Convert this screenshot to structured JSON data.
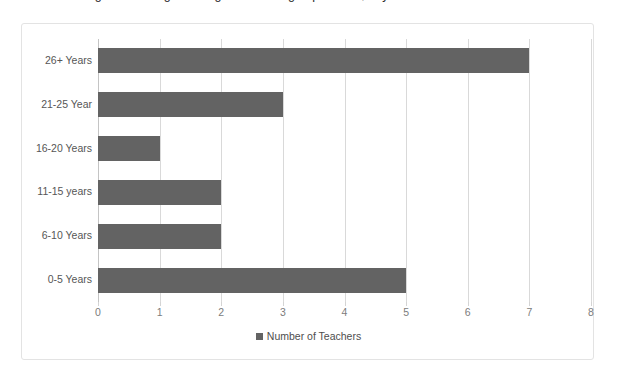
{
  "top_caption": {
    "fragment_text": "Figure showing the range of teaching experience, in years"
  },
  "chart_data": {
    "type": "bar",
    "orientation": "horizontal",
    "title": "",
    "xlabel": "",
    "ylabel": "",
    "categories": [
      "26+ Years",
      "21-25 Year",
      "16-20 Years",
      "11-15 years",
      "6-10 Years",
      "0-5 Years"
    ],
    "values": [
      7,
      3,
      1,
      2,
      2,
      5
    ],
    "series": [
      {
        "name": "Number of Teachers",
        "values": [
          7,
          3,
          1,
          2,
          2,
          5
        ],
        "color": "#636363"
      }
    ],
    "xlim": [
      0,
      8
    ],
    "xticks": [
      "0",
      "1",
      "2",
      "3",
      "4",
      "5",
      "6",
      "7",
      "8"
    ],
    "xtick_values": [
      0,
      1,
      2,
      3,
      4,
      5,
      6,
      7,
      8
    ],
    "grid": "vertical",
    "legend": {
      "position": "bottom",
      "entries": [
        "Number of Teachers"
      ]
    },
    "colors": {
      "bar": "#636363",
      "gridline": "#d9d9d9",
      "frame_border": "#e3e3e3",
      "category_label": "#565656",
      "tick_label": "#7c7c7c",
      "legend_label": "#4e4e4e",
      "background": "#ffffff"
    }
  }
}
